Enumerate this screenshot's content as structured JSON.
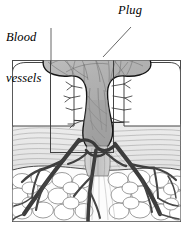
{
  "figure": {
    "name": "wound-hemostatic-plug-cross-section",
    "background": "#ffffff",
    "width": 193,
    "height": 228
  },
  "labels": {
    "blood_vessels": {
      "line1": "Blood",
      "line2": "vessels",
      "style": "italic-serif"
    },
    "plug": {
      "text": "Plug",
      "style": "italic-serif"
    }
  },
  "colors": {
    "ink": "#1a1a1a",
    "frame": "#4a4a4a",
    "plug_fill": "#b4b4b4",
    "plug_fill_light": "#c8c8c8",
    "plug_outline": "#111111",
    "plug_fiber": "#6e6e6e",
    "dermis_fill": "#e8e8e8",
    "dermis_hatch": "#9a9a9a",
    "epidermis_fill": "#ffffff",
    "epidermis_outline": "#3a3a3a",
    "fat_fill": "#fbfbfb",
    "fat_outline": "#7a7a7a",
    "vessel": "#454545",
    "vessel_dark": "#2e2e2e",
    "callout_box": "#3a3a3a",
    "leader_line": "#555555"
  },
  "structures": [
    {
      "name": "plug",
      "label": "Plug",
      "description": "mushroom-shaped gray fibrin clot protruding above skin surface"
    },
    {
      "name": "blood-vessels",
      "label": "Blood vessels",
      "description": "dark branching vascular tree feeding the wound bed"
    },
    {
      "name": "epidermis",
      "label": "Epidermis",
      "description": "white surface blocks flanking the wound on left and right"
    },
    {
      "name": "dermis",
      "label": "Dermis",
      "description": "light gray band with fine horizontal wavy hatching"
    },
    {
      "name": "subcutaneous-fat",
      "label": "Subcutaneous fat",
      "description": "rounded lobular fat cells at the base"
    }
  ],
  "annotations": {
    "callout_box": "magnification detail rectangle over left wound margin",
    "leader_blood_vessels": "line from label down-right to vessel branch",
    "leader_plug": "line from label down-left into plug body"
  }
}
